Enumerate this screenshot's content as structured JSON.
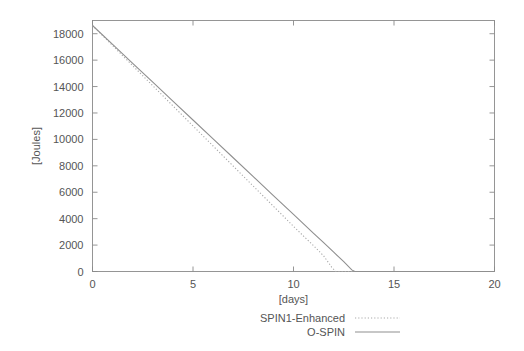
{
  "chart_data": {
    "type": "line",
    "title": "",
    "xlabel": "[days]",
    "ylabel": "[Joules]",
    "xlim": [
      0,
      20
    ],
    "ylim": [
      0,
      19000
    ],
    "xticks": [
      0,
      5,
      10,
      15,
      20
    ],
    "xtick_labels": [
      "0",
      "5",
      "10",
      "15",
      "20"
    ],
    "yticks": [
      0,
      2000,
      4000,
      6000,
      8000,
      10000,
      12000,
      14000,
      16000,
      18000
    ],
    "ytick_labels": [
      "0",
      "2000",
      "4000",
      "6000",
      "8000",
      "10000",
      "12000",
      "14000",
      "16000",
      "18000"
    ],
    "grid": false,
    "legend_position": "below-center",
    "series": [
      {
        "name": "SPIN1-Enhanced",
        "style": "dotted",
        "color": "#aaaaaa",
        "x": [
          0,
          1,
          2,
          3,
          4,
          5,
          6,
          7,
          8,
          9,
          10,
          10.5,
          11,
          11.5,
          11.9,
          12.1,
          13,
          15,
          17,
          20
        ],
        "y": [
          18620,
          17100,
          15580,
          14060,
          12540,
          11020,
          9500,
          7980,
          6460,
          4940,
          3420,
          2680,
          1950,
          1180,
          330,
          0,
          0,
          0,
          0,
          0
        ]
      },
      {
        "name": "O-SPIN",
        "style": "solid",
        "color": "#8f8f8f",
        "x": [
          0,
          1,
          2,
          3,
          4,
          5,
          6,
          7,
          8,
          9,
          10,
          11,
          11.5,
          12,
          12.5,
          12.9,
          13.05,
          14,
          15,
          17,
          20
        ],
        "y": [
          18620,
          17190,
          15760,
          14330,
          12900,
          11470,
          10040,
          8610,
          7180,
          5750,
          4320,
          2890,
          2180,
          1460,
          740,
          120,
          0,
          0,
          0,
          0,
          0
        ]
      }
    ]
  },
  "legend": {
    "entries": [
      {
        "label": "SPIN1-Enhanced",
        "style": "dotted"
      },
      {
        "label": "O-SPIN",
        "style": "solid"
      }
    ]
  }
}
